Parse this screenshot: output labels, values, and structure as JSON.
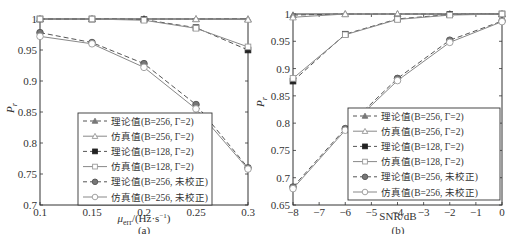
{
  "chart_data": [
    {
      "id": "a",
      "type": "line",
      "caption": "(a)",
      "xlabel": "μerr/(Hz·s⁻¹)",
      "ylabel": "Pr",
      "xlim": [
        0.1,
        0.3
      ],
      "ylim": [
        0.7,
        1.0
      ],
      "xticks": [
        "0.1",
        "0.15",
        "0.2",
        "0.25",
        "0.3"
      ],
      "yticks": [
        "0.7",
        "0.75",
        "0.8",
        "0.85",
        "0.9",
        "0.95",
        "1"
      ],
      "grid": false,
      "legend_position": "lower-center",
      "x": [
        0.1,
        0.15,
        0.2,
        0.25,
        0.3
      ],
      "series": [
        {
          "name": "理论值(B=256, Γ=2)",
          "values": [
            1.0,
            1.0,
            1.0,
            1.0,
            1.0
          ]
        },
        {
          "name": "仿真值(B=256, Γ=2)",
          "values": [
            1.0,
            1.0,
            1.0,
            1.0,
            0.999
          ]
        },
        {
          "name": "理论值(B=128, Γ=2)",
          "values": [
            1.0,
            1.0,
            0.999,
            0.986,
            0.95
          ]
        },
        {
          "name": "仿真值(B=128, Γ=2)",
          "values": [
            1.0,
            1.0,
            0.998,
            0.985,
            0.955
          ]
        },
        {
          "name": "理论值(B=256, 未校正)",
          "values": [
            0.978,
            0.962,
            0.928,
            0.862,
            0.76
          ]
        },
        {
          "name": "仿真值(B=256, 未校正)",
          "values": [
            0.972,
            0.96,
            0.922,
            0.855,
            0.758
          ]
        }
      ]
    },
    {
      "id": "b",
      "type": "line",
      "caption": "(b)",
      "xlabel": "SNR/dB",
      "ylabel": "Pr",
      "xlim": [
        -8,
        0
      ],
      "ylim": [
        0.65,
        1.0
      ],
      "xticks": [
        "−8",
        "−7",
        "−6",
        "−5",
        "−4",
        "−3",
        "−2",
        "−1",
        "0"
      ],
      "yticks": [
        "0.65",
        "0.7",
        "0.75",
        "0.8",
        "0.85",
        "0.9",
        "0.95",
        "1"
      ],
      "grid": false,
      "legend_position": "lower-right",
      "x": [
        -8,
        -6,
        -4,
        -2,
        0
      ],
      "series": [
        {
          "name": "理论值(B=256, Γ=2)",
          "values": [
            0.998,
            1.0,
            1.0,
            1.0,
            1.0
          ]
        },
        {
          "name": "仿真值(B=256, Γ=2)",
          "values": [
            0.994,
            1.0,
            1.0,
            1.0,
            1.0
          ]
        },
        {
          "name": "理论值(B=128, Γ=2)",
          "values": [
            0.877,
            0.963,
            0.991,
            0.999,
            1.0
          ]
        },
        {
          "name": "仿真值(B=128, Γ=2)",
          "values": [
            0.882,
            0.962,
            0.99,
            0.998,
            1.0
          ]
        },
        {
          "name": "理论值(B=256, 未校正)",
          "values": [
            0.683,
            0.79,
            0.882,
            0.952,
            0.987
          ]
        },
        {
          "name": "仿真值(B=256, 未校正)",
          "values": [
            0.68,
            0.787,
            0.878,
            0.948,
            0.986
          ]
        }
      ]
    }
  ],
  "legend": [
    {
      "label": "理论值(B=256, Γ=2)",
      "line": "dashed",
      "marker": "triangle-filled"
    },
    {
      "label": "仿真值(B=256, Γ=2)",
      "line": "solid",
      "marker": "triangle-open"
    },
    {
      "label": "理论值(B=128, Γ=2)",
      "line": "dashed",
      "marker": "square-filled"
    },
    {
      "label": "仿真值(B=128, Γ=2)",
      "line": "solid",
      "marker": "square-open"
    },
    {
      "label": "理论值(B=256, 未校正)",
      "line": "dashed",
      "marker": "circle-filled"
    },
    {
      "label": "仿真值(B=256, 未校正)",
      "line": "solid",
      "marker": "circle-open"
    }
  ],
  "labels": {
    "a_xlabel_main": "μ",
    "a_xlabel_sub": "err",
    "a_xlabel_rest": "/(Hz·s",
    "a_xlabel_sup": "−1",
    "a_xlabel_close": ")",
    "b_xlabel": "SNR/dB",
    "ylabel_main": "P",
    "ylabel_sub": "r",
    "caption_a": "(a)",
    "caption_b": "(b)"
  },
  "colors": {
    "axis": "#333333",
    "theory": "#555555",
    "sim": "#888888",
    "filled_dark": "#222222",
    "filled_gray": "#777777",
    "open_gray": "#999999"
  }
}
